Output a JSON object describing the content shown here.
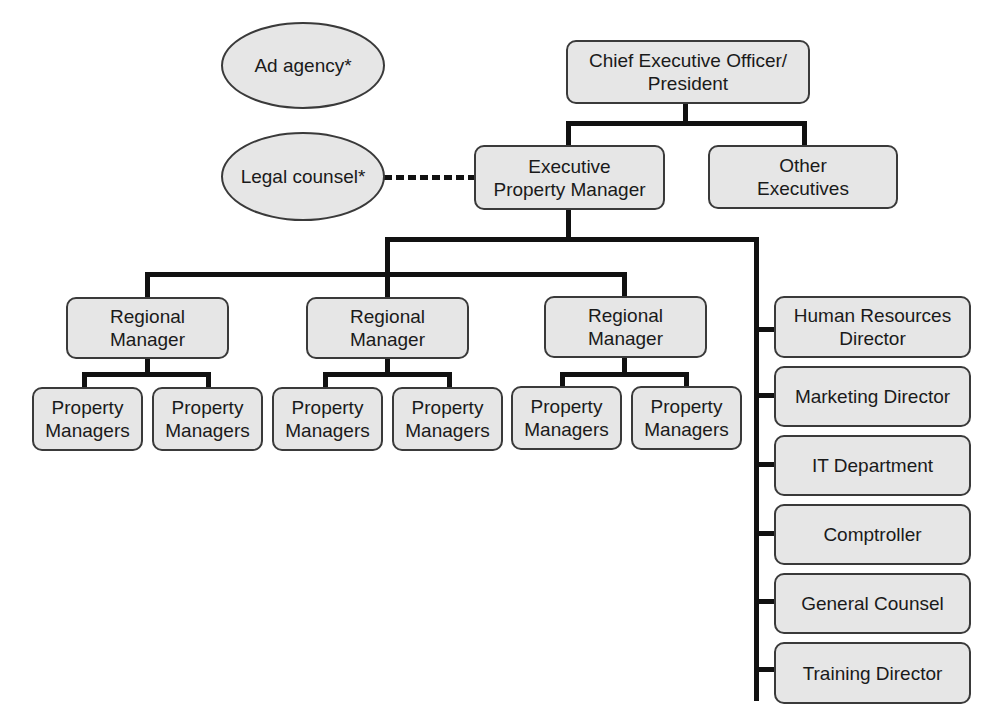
{
  "diagram": {
    "type": "org-chart",
    "colors": {
      "box_fill": "#e6e6e6",
      "box_border": "#3a3a3a",
      "line": "#111111"
    },
    "advisors": [
      {
        "label": "Ad agency*"
      },
      {
        "label": "Legal counsel*"
      }
    ],
    "ceo": {
      "label": "Chief Executive Officer/\nPresident"
    },
    "executive_property_manager": {
      "label": "Executive\nProperty Manager"
    },
    "other_executives": {
      "label": "Other\nExecutives"
    },
    "regional_managers": [
      {
        "label": "Regional\nManager",
        "property_managers": [
          "Property\nManagers",
          "Property\nManagers"
        ]
      },
      {
        "label": "Regional\nManager",
        "property_managers": [
          "Property\nManagers",
          "Property\nManagers"
        ]
      },
      {
        "label": "Regional\nManager",
        "property_managers": [
          "Property\nManagers",
          "Property\nManagers"
        ]
      }
    ],
    "departments": [
      {
        "label": "Human Resources\nDirector"
      },
      {
        "label": "Marketing Director"
      },
      {
        "label": "IT Department"
      },
      {
        "label": "Comptroller"
      },
      {
        "label": "General Counsel"
      },
      {
        "label": "Training Director"
      }
    ],
    "relations": [
      {
        "from": "Chief Executive Officer/President",
        "to": "Executive Property Manager",
        "style": "solid"
      },
      {
        "from": "Chief Executive Officer/President",
        "to": "Other Executives",
        "style": "solid"
      },
      {
        "from": "Legal counsel*",
        "to": "Executive Property Manager",
        "style": "dashed"
      },
      {
        "from": "Executive Property Manager",
        "to": "Regional Manager",
        "style": "solid"
      },
      {
        "from": "Executive Property Manager",
        "to": "Departments",
        "style": "solid"
      },
      {
        "from": "Regional Manager",
        "to": "Property Managers",
        "style": "solid"
      }
    ]
  }
}
